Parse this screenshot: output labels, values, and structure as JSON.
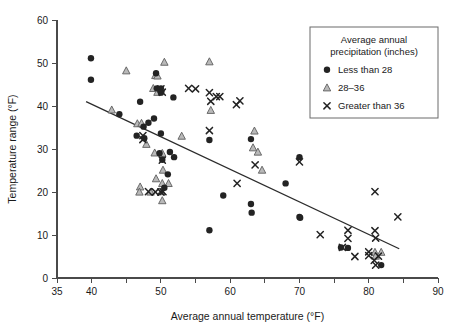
{
  "chart_data": {
    "type": "scatter",
    "title": "",
    "xlabel": "Average annual temperature (°F)",
    "ylabel": "Temperature range (°F)",
    "xlim": [
      35,
      90
    ],
    "ylim": [
      0,
      60
    ],
    "xticks": [
      35,
      40,
      45,
      50,
      55,
      60,
      65,
      70,
      75,
      80,
      85,
      90
    ],
    "xtick_labels": [
      "35",
      "40",
      "",
      "50",
      "",
      "60",
      "",
      "70",
      "",
      "80",
      "",
      "90"
    ],
    "yticks": [
      0,
      10,
      20,
      30,
      40,
      50,
      60
    ],
    "ytick_labels": [
      "0",
      "10",
      "20",
      "30",
      "40",
      "50",
      "60"
    ],
    "grid": false,
    "legend": {
      "position": "top-right",
      "title_line1": "Average annual",
      "title_line2": "precipitation (inches)",
      "entries": [
        {
          "marker": "circle",
          "label": "Less than 28",
          "color": "#232323"
        },
        {
          "marker": "triangle",
          "label": "28–36",
          "color": "#b9b9b9"
        },
        {
          "marker": "x",
          "label": "Greater than 36",
          "color": "#232323"
        }
      ]
    },
    "trend_line": {
      "x": [
        39.2,
        84.4
      ],
      "y": [
        41.0,
        6.8
      ]
    },
    "series": [
      {
        "name": "Less than 28",
        "marker": "circle",
        "points": [
          [
            39.9,
            51.1
          ],
          [
            39.9,
            46.1
          ],
          [
            44.0,
            38.1
          ],
          [
            46.5,
            33.1
          ],
          [
            47.5,
            35.2
          ],
          [
            47.6,
            32.5
          ],
          [
            48.2,
            36.1
          ],
          [
            49.0,
            37.1
          ],
          [
            49.3,
            47.6
          ],
          [
            49.4,
            44.1
          ],
          [
            50.0,
            44.1
          ],
          [
            50.0,
            43.1
          ],
          [
            50.0,
            33.6
          ],
          [
            50.2,
            27.5
          ],
          [
            47.0,
            41.0
          ],
          [
            51.0,
            24.1
          ],
          [
            51.8,
            42.0
          ],
          [
            51.9,
            28.1
          ],
          [
            50.5,
            21.0
          ],
          [
            49.8,
            29.0
          ],
          [
            51.3,
            29.3
          ],
          [
            57.0,
            32.1
          ],
          [
            57.0,
            11.1
          ],
          [
            59.0,
            19.2
          ],
          [
            63.0,
            32.3
          ],
          [
            63.0,
            17.2
          ],
          [
            63.1,
            15.2
          ],
          [
            68.0,
            22.0
          ],
          [
            70.0,
            28.1
          ],
          [
            70.0,
            14.2
          ],
          [
            70.1,
            14.0
          ],
          [
            76.0,
            7.1
          ],
          [
            81.8,
            3.0
          ],
          [
            77.0,
            7.0
          ]
        ]
      },
      {
        "name": "28–36",
        "marker": "triangle",
        "points": [
          [
            42.9,
            39.1
          ],
          [
            45.0,
            48.2
          ],
          [
            46.6,
            35.9
          ],
          [
            47.2,
            36.0
          ],
          [
            47.9,
            31.1
          ],
          [
            48.9,
            44.1
          ],
          [
            49.2,
            47.1
          ],
          [
            49.5,
            47.0
          ],
          [
            49.5,
            43.2
          ],
          [
            50.5,
            50.2
          ],
          [
            49.1,
            29.1
          ],
          [
            50.2,
            29.0
          ],
          [
            50.3,
            25.1
          ],
          [
            49.3,
            23.1
          ],
          [
            47.0,
            21.2
          ],
          [
            46.9,
            20.0
          ],
          [
            48.5,
            20.0
          ],
          [
            50.1,
            20.1
          ],
          [
            50.2,
            22.0
          ],
          [
            51.1,
            22.0
          ],
          [
            50.2,
            18.0
          ],
          [
            53.0,
            33.0
          ],
          [
            57.0,
            50.3
          ],
          [
            57.2,
            39.0
          ],
          [
            63.5,
            34.2
          ],
          [
            63.3,
            30.3
          ],
          [
            64.0,
            29.3
          ],
          [
            64.6,
            25.1
          ],
          [
            80.9,
            6.0
          ],
          [
            81.8,
            6.0
          ],
          [
            81.0,
            5.1
          ]
        ]
      },
      {
        "name": "Greater than 36",
        "marker": "x",
        "points": [
          [
            47.4,
            32.2
          ],
          [
            47.4,
            33.1
          ],
          [
            50.0,
            44.0
          ],
          [
            50.2,
            43.2
          ],
          [
            50.2,
            27.4
          ],
          [
            49.2,
            20.0
          ],
          [
            50.0,
            20.0
          ],
          [
            50.3,
            20.1
          ],
          [
            48.2,
            20.1
          ],
          [
            54.0,
            44.1
          ],
          [
            55.0,
            44.0
          ],
          [
            57.0,
            43.1
          ],
          [
            57.2,
            41.1
          ],
          [
            58.0,
            42.2
          ],
          [
            58.5,
            42.2
          ],
          [
            60.9,
            40.3
          ],
          [
            61.4,
            41.2
          ],
          [
            57.0,
            34.3
          ],
          [
            61.0,
            22.0
          ],
          [
            63.6,
            26.3
          ],
          [
            70.0,
            27.0
          ],
          [
            73.0,
            10.1
          ],
          [
            76.2,
            7.1
          ],
          [
            77.0,
            11.1
          ],
          [
            77.0,
            9.2
          ],
          [
            78.0,
            5.0
          ],
          [
            80.9,
            20.1
          ],
          [
            80.9,
            11.0
          ],
          [
            81.0,
            9.3
          ],
          [
            80.0,
            6.1
          ],
          [
            80.8,
            4.1
          ],
          [
            81.0,
            3.0
          ],
          [
            81.4,
            5.1
          ],
          [
            84.2,
            14.2
          ],
          [
            80.0,
            5.2
          ]
        ]
      }
    ]
  }
}
